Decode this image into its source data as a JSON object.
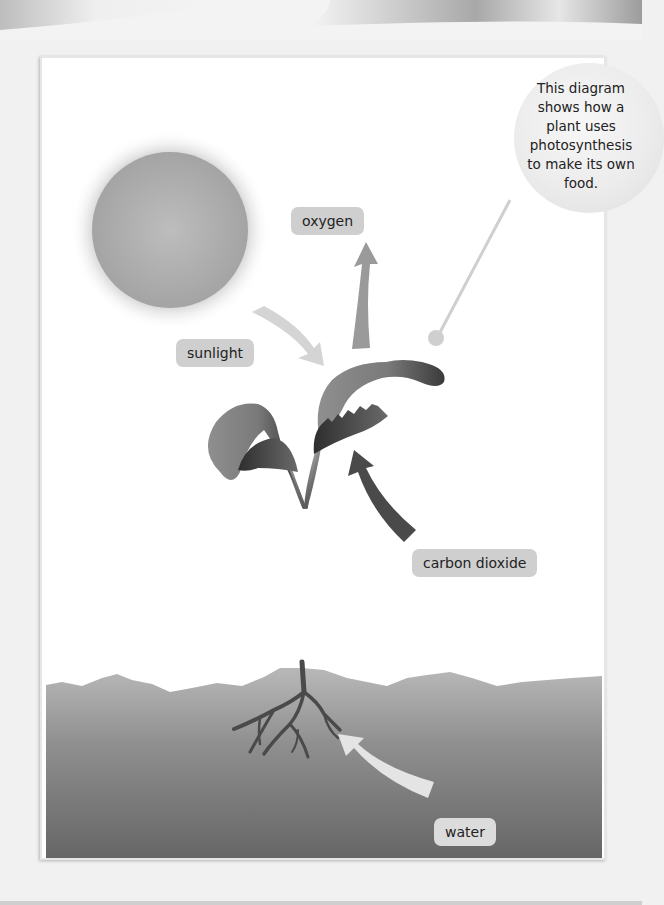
{
  "diagram": {
    "topic": "photosynthesis",
    "callout": {
      "text": "This diagram shows how a plant uses photosynthesis to make its own food."
    },
    "labels": {
      "oxygen": "oxygen",
      "sunlight": "sunlight",
      "carbon_dioxide": "carbon dioxide",
      "water": "water"
    },
    "elements": {
      "sun": "sun",
      "plant": "seedling with leaves, stem and roots",
      "soil": "soil"
    },
    "arrows": [
      {
        "from": "sun",
        "to": "leaves",
        "label": "sunlight",
        "shade": "#d2d2d2"
      },
      {
        "from": "leaves",
        "to": "air",
        "label": "oxygen",
        "shade": "#9a9a9a"
      },
      {
        "from": "air",
        "to": "leaves",
        "label": "carbon dioxide",
        "shade": "#4a4a4a"
      },
      {
        "from": "soil",
        "to": "roots",
        "label": "water",
        "shade": "#e2e2e2"
      }
    ],
    "colors": {
      "frame_bg": "#ffffff",
      "label_bg": "#cfcfcf",
      "soil_top": "#b5b5b5",
      "soil_bottom": "#6a6a6a",
      "leaf_light": "#8e8e8e",
      "leaf_dark": "#3e3e3e"
    }
  }
}
